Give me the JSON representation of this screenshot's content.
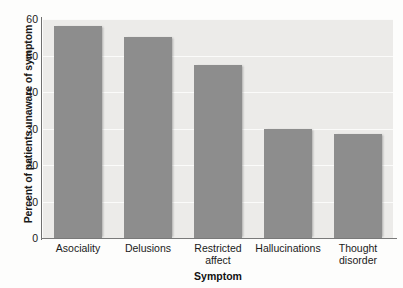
{
  "chart_data": {
    "type": "bar",
    "title": "",
    "subtitle": "",
    "xlabel": "Symptom",
    "ylabel": "Percent of patients unaware of symptom",
    "categories": [
      "Asociality",
      "Delusions",
      "Restricted affect",
      "Hallucinations",
      "Thought disorder"
    ],
    "category_lines": [
      [
        "Asociality"
      ],
      [
        "Delusions"
      ],
      [
        "Restricted",
        "affect"
      ],
      [
        "Hallucinations"
      ],
      [
        "Thought",
        "disorder"
      ]
    ],
    "values": [
      58,
      55,
      47.5,
      30,
      28.5
    ],
    "ylim": [
      0,
      60
    ],
    "yticks": [
      0,
      10,
      20,
      30,
      40,
      50,
      60
    ],
    "ytick_labels": [
      "0",
      "10",
      "20",
      "30",
      "40",
      "50",
      "60"
    ],
    "grid": true,
    "legend": "none",
    "colors": {
      "bar": "#8d8d8d",
      "plot_background": "#ecebe9",
      "gridline": "#fbfbfa",
      "axis": "#6f6f6f",
      "text": "#1a1a1a",
      "figure_background": "#fdfdfc"
    }
  }
}
